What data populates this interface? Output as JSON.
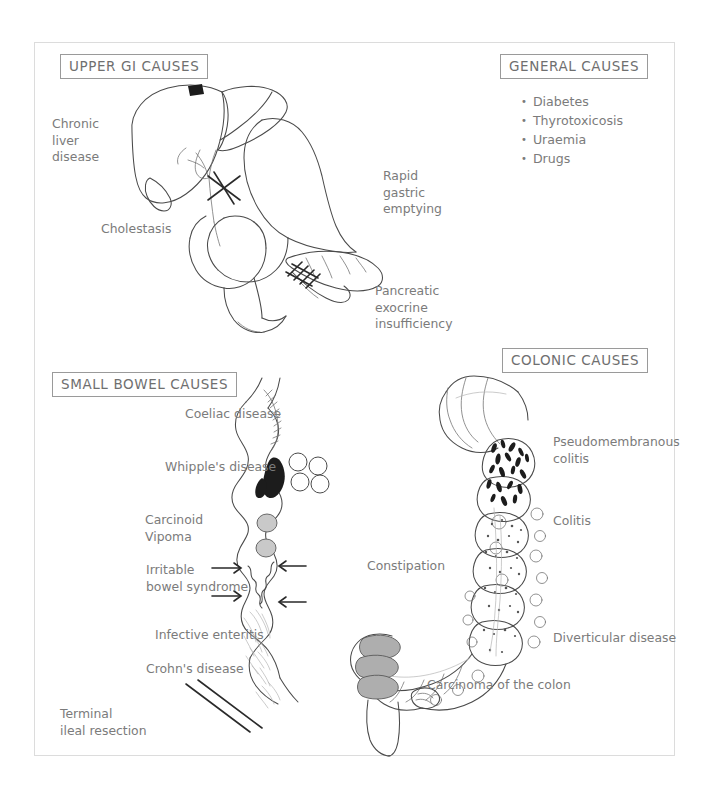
{
  "page": {
    "background": "#ffffff",
    "frame_color": "#dcdcdc",
    "ink_color": "#4a4a4a",
    "label_color": "#7b7b7b"
  },
  "sections": {
    "upper_gi": {
      "title": "UPPER GI CAUSES",
      "labels": {
        "chronic_liver_disease": "Chronic\nliver\ndisease",
        "cholestasis": "Cholestasis",
        "rapid_gastric_emptying": "Rapid\ngastric\nemptying",
        "pancreatic_exocrine_insufficiency": "Pancreatic\nexocrine\ninsufficiency"
      }
    },
    "general": {
      "title": "GENERAL CAUSES",
      "items": [
        "Diabetes",
        "Thyrotoxicosis",
        "Uraemia",
        "Drugs"
      ]
    },
    "small_bowel": {
      "title": "SMALL BOWEL CAUSES",
      "labels": {
        "coeliac_disease": "Coeliac disease",
        "whipples_disease": "Whipple's disease",
        "carcinoid_vipoma": "Carcinoid\nVipoma",
        "irritable_bowel_syndrome": "Irritable\nbowel syndrome",
        "infective_enteritis": "Infective enteritis",
        "crohns_disease": "Crohn's disease",
        "terminal_ileal_resection": "Terminal\nileal resection"
      }
    },
    "colonic": {
      "title": "COLONIC CAUSES",
      "labels": {
        "pseudomembranous_colitis": "Pseudomembranous\ncolitis",
        "colitis": "Colitis",
        "constipation": "Constipation",
        "diverticular_disease": "Diverticular disease",
        "carcinoma_of_the_colon": "Carcinoma of the colon"
      }
    }
  }
}
